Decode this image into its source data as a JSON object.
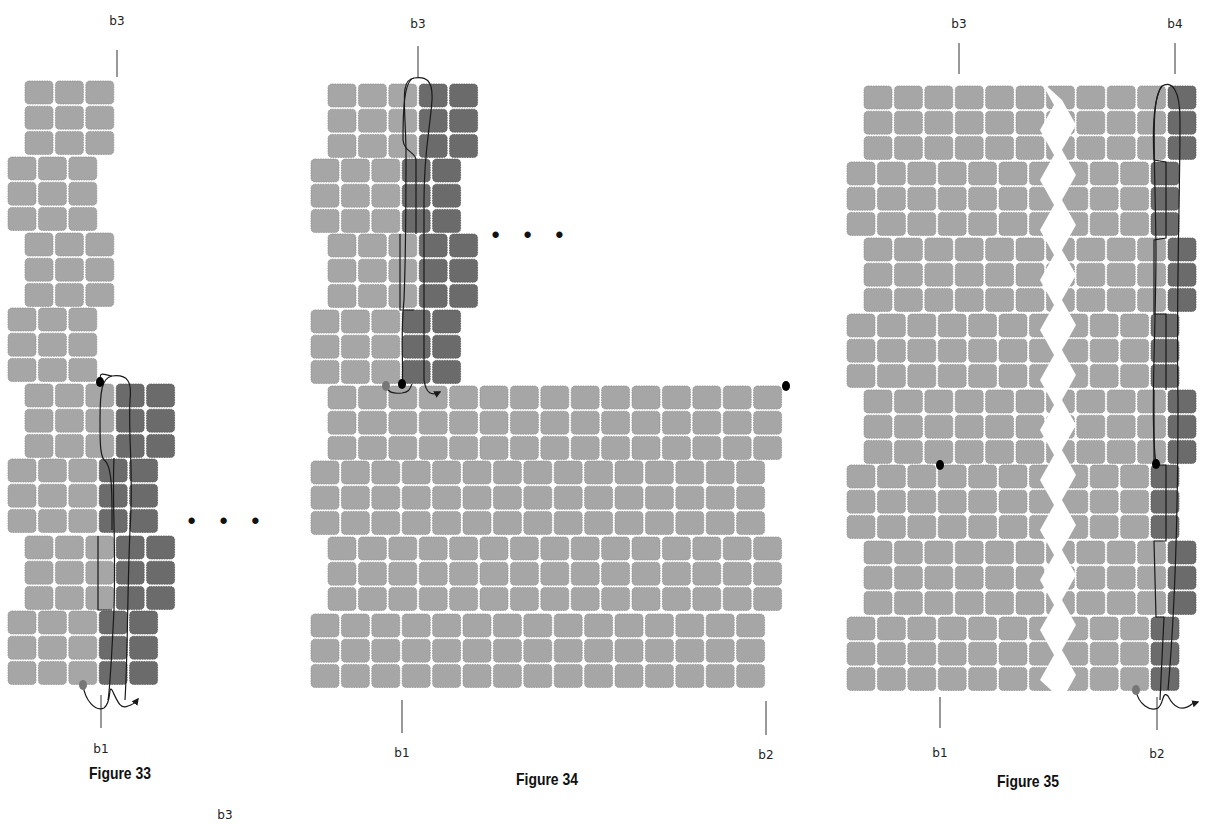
{
  "colors": {
    "bead_light": "#a6a6a6",
    "bead_dark": "#6b6b6b",
    "bead_stroke": "#8e8e8e",
    "thread": "#1a1a1a",
    "start_dot": "#777777",
    "dot": "#000000"
  },
  "bead": {
    "w": 28,
    "h": 23,
    "px": 30.4,
    "py": 25.2,
    "r": 4
  },
  "figures": [
    {
      "id": "fig33",
      "caption": "Figure 33",
      "caption_x": 120,
      "caption_y": 764,
      "labels": [
        {
          "text": "b3",
          "x": 117,
          "y": 14,
          "line": [
            117,
            50,
            117,
            77
          ]
        },
        {
          "text": "b1",
          "x": 101,
          "y": 742,
          "line": [
            101,
            695,
            101,
            728
          ]
        }
      ],
      "continuation": {
        "text": "• • •",
        "x": 224,
        "y": 508
      },
      "bands": [
        {
          "x": 25,
          "y": 81,
          "rows": 3,
          "light": 3,
          "dark": 0
        },
        {
          "x": 8,
          "y": 157,
          "rows": 3,
          "light": 3,
          "dark": 0
        },
        {
          "x": 25,
          "y": 233,
          "rows": 3,
          "light": 3,
          "dark": 0
        },
        {
          "x": 8,
          "y": 308,
          "rows": 3,
          "light": 3,
          "dark": 0
        },
        {
          "x": 25,
          "y": 384,
          "rows": 3,
          "light": 3,
          "dark": 2
        },
        {
          "x": 8,
          "y": 459,
          "rows": 3,
          "light": 3,
          "dark": 2
        },
        {
          "x": 25,
          "y": 536,
          "rows": 3,
          "light": 3,
          "dark": 2
        },
        {
          "x": 8,
          "y": 611,
          "rows": 3,
          "light": 3,
          "dark": 2
        }
      ],
      "dots": [
        {
          "x": 100,
          "y": 382,
          "fill": "dot"
        },
        {
          "x": 83,
          "y": 685,
          "fill": "start_dot"
        }
      ],
      "threads": [
        "M 101 382 C 98 370 104 375 112 376 C 128 374 132 382 130 400 C 128 440 134 470 130 530 C 127 600 128 650 125 700",
        "M 112 376 C 102 378 100 390 100 420 C 100 440 100 455 104 460 C 113 465 112 500 112 530",
        "M 114 458 C 112 500 116 540 114 610 C 112 650 110 690 108 700",
        "M 98 536 L 98 610 L 112 610",
        "M 83 685 C 85 700 95 712 104 708 C 112 702 108 685 112 690 C 117 700 120 710 128 706 C 132 705 135 703 138 699"
      ],
      "arrow": {
        "x": 138,
        "y": 699
      }
    },
    {
      "id": "fig34",
      "caption": "Figure 34",
      "caption_x": 547,
      "caption_y": 770,
      "labels": [
        {
          "text": "b3",
          "x": 418,
          "y": 17,
          "line": [
            418,
            46,
            418,
            78
          ]
        },
        {
          "text": "b1",
          "x": 402,
          "y": 746,
          "line": [
            402,
            700,
            402,
            733
          ]
        },
        {
          "text": "b2",
          "x": 766,
          "y": 748,
          "line": [
            766,
            701,
            766,
            735
          ]
        }
      ],
      "continuation": {
        "text": "• • •",
        "x": 528,
        "y": 228
      },
      "bands": [
        {
          "x": 328,
          "y": 84,
          "rows": 3,
          "light": 3,
          "dark": 2
        },
        {
          "x": 311,
          "y": 159,
          "rows": 3,
          "light": 3,
          "dark": 2
        },
        {
          "x": 328,
          "y": 234,
          "rows": 3,
          "light": 3,
          "dark": 2
        },
        {
          "x": 311,
          "y": 310,
          "rows": 3,
          "light": 3,
          "dark": 2
        },
        {
          "x": 328,
          "y": 386,
          "rows": 3,
          "light": 15,
          "dark": 0
        },
        {
          "x": 311,
          "y": 461,
          "rows": 3,
          "light": 15,
          "dark": 0
        },
        {
          "x": 328,
          "y": 537,
          "rows": 3,
          "light": 15,
          "dark": 0
        },
        {
          "x": 311,
          "y": 614,
          "rows": 3,
          "light": 15,
          "dark": 0
        }
      ],
      "dots": [
        {
          "x": 402,
          "y": 384,
          "fill": "dot"
        },
        {
          "x": 386,
          "y": 386,
          "fill": "start_dot"
        },
        {
          "x": 786,
          "y": 386,
          "fill": "dot"
        }
      ],
      "threads": [
        "M 402 384 C 404 370 400 340 404 300 C 406 250 406 200 406 150 C 405 100 400 80 414 78 C 426 76 433 80 432 100 C 430 130 424 150 424 200 C 424 260 424 320 424 380",
        "M 414 78 C 404 80 403 110 403 140 C 404 152 416 152 416 160 L 416 234",
        "M 400 234 L 400 310 L 414 310",
        "M 386 386 C 388 392 392 394 402 393 C 410 392 410 388 412 384",
        "M 424 380 C 426 394 432 396 440 392"
      ],
      "arrow": {
        "x": 440,
        "y": 390
      }
    },
    {
      "id": "fig35",
      "caption": "Figure 35",
      "caption_x": 1028,
      "caption_y": 772,
      "labels": [
        {
          "text": "b3",
          "x": 959,
          "y": 17,
          "line": [
            959,
            43,
            959,
            74
          ]
        },
        {
          "text": "b4",
          "x": 1175,
          "y": 17,
          "line": [
            1175,
            43,
            1175,
            74
          ]
        },
        {
          "text": "b1",
          "x": 940,
          "y": 746,
          "line": [
            940,
            697,
            940,
            728
          ]
        },
        {
          "text": "b2",
          "x": 1157,
          "y": 747,
          "line": [
            1157,
            697,
            1157,
            730
          ]
        }
      ],
      "bands": [
        {
          "x": 864,
          "y": 86,
          "rows": 3,
          "light": 10,
          "dark": 1
        },
        {
          "x": 847,
          "y": 162,
          "rows": 3,
          "light": 10,
          "dark": 1
        },
        {
          "x": 864,
          "y": 238,
          "rows": 3,
          "light": 10,
          "dark": 1
        },
        {
          "x": 847,
          "y": 314,
          "rows": 3,
          "light": 10,
          "dark": 1
        },
        {
          "x": 864,
          "y": 390,
          "rows": 3,
          "light": 10,
          "dark": 1
        },
        {
          "x": 847,
          "y": 465,
          "rows": 3,
          "light": 10,
          "dark": 1
        },
        {
          "x": 864,
          "y": 541,
          "rows": 3,
          "light": 10,
          "dark": 1
        },
        {
          "x": 847,
          "y": 617,
          "rows": 3,
          "light": 10,
          "dark": 1
        }
      ],
      "break_x": 1040,
      "dots": [
        {
          "x": 940,
          "y": 465,
          "fill": "dot"
        },
        {
          "x": 1156,
          "y": 464,
          "fill": "dot"
        },
        {
          "x": 1136,
          "y": 690,
          "fill": "start_dot"
        }
      ],
      "threads": [
        "M 1156 464 C 1150 420 1156 330 1156 250 C 1155 150 1150 100 1162 86 C 1172 80 1180 90 1180 120 C 1180 200 1176 300 1178 400 C 1178 500 1176 600 1168 690",
        "M 1162 86 C 1152 100 1153 140 1154 160 L 1166 162 L 1166 238 L 1154 240 L 1154 314 L 1166 314 L 1166 390",
        "M 1154 390 L 1154 465 L 1166 465 L 1166 541 L 1154 541 L 1156 617 L 1164 617 L 1160 700",
        "M 1136 690 C 1138 704 1150 712 1158 708 C 1164 704 1162 690 1168 696 C 1174 708 1182 712 1192 704 L 1198 702"
      ],
      "arrow": {
        "x": 1198,
        "y": 702
      }
    }
  ],
  "stray_label": {
    "text": "b3",
    "x": 225,
    "y": 810
  }
}
